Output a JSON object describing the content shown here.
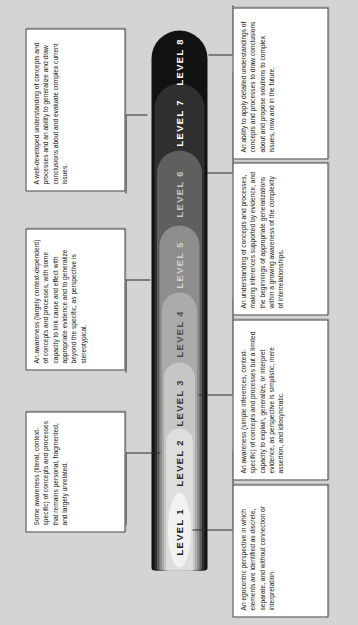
{
  "diagram": {
    "title": "Progress Map for Science Learning",
    "type": "progress-map",
    "background_color": "#d4d4d4",
    "shape": "nested-teardrop-cone"
  },
  "levels": [
    {
      "label": "LEVEL 1",
      "index": 1,
      "fill": "#f2f2f0",
      "text_color": "#1a1a1a"
    },
    {
      "label": "LEVEL 2",
      "index": 2,
      "fill": "#dededc",
      "text_color": "#2b2b2b"
    },
    {
      "label": "LEVEL 3",
      "index": 3,
      "fill": "#c6c6c4",
      "text_color": "#3a3a3a"
    },
    {
      "label": "LEVEL 4",
      "index": 4,
      "fill": "#ababa9",
      "text_color": "#4a4a4a"
    },
    {
      "label": "LEVEL 5",
      "index": 5,
      "fill": "#8d8d8b",
      "text_color": "#d8d8d6"
    },
    {
      "label": "LEVEL 6",
      "index": 6,
      "fill": "#5f5f5e",
      "text_color": "#c9c9c7"
    },
    {
      "label": "LEVEL 7",
      "index": 7,
      "fill": "#2f2f2f",
      "text_color": "#ffffff"
    },
    {
      "label": "LEVEL 8",
      "index": 8,
      "fill": "#121212",
      "text_color": "#ffffff"
    }
  ],
  "descriptions": {
    "left": [
      {
        "id": "desc-level-7-8",
        "text": "A well-developed understanding of concepts and processes and an ability to generalize and draw conclusions about and evaluate complex current issues."
      },
      {
        "id": "desc-level-4-5",
        "text": "An awareness (largely context-dependent) of concepts and processes, with some capacity to link cause and effect with appropriate evidence and to generalize beyond the specific, as perspective is stereotypical."
      },
      {
        "id": "desc-level-1-2",
        "text": "Some awareness (literal, context-specific) of concepts and processes that remains personal, fragmented, and largely unrelated."
      }
    ],
    "right": [
      {
        "id": "desc-level-8",
        "text": "An ability to apply detailed understandings of concepts and processes to draw conclusions about and propose solutions to complex issues, now and in the future."
      },
      {
        "id": "desc-level-6",
        "text": "An understanding of concepts and processes, making inferences supported by evidence, and the beginnings of appropriate generalizations within a growing awareness of the complexity of interrelationships."
      },
      {
        "id": "desc-level-3",
        "text": "An awareness (simple inferences, context-specific) of concepts and processes but a limited capacity to explain, generalize, or interpret evidence, as perspective is simplistic, mere assertion, and idiosyncratic."
      },
      {
        "id": "desc-level-1",
        "text": "An egocentric perspective in which elements are identified as discrete, separate, and without connection or interpretation."
      }
    ]
  }
}
